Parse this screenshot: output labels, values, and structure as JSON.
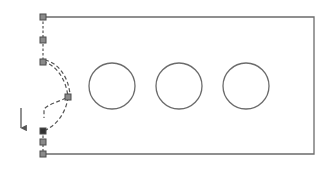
{
  "diagram": {
    "title": "",
    "colors": {
      "outline": "#6b6b6b",
      "node_fill": "#8a8a8a",
      "node_stroke": "#4a4a4a",
      "node_dark_fill": "#333333",
      "dashed": "#555555",
      "arrow": "#555555",
      "background": "#ffffff"
    },
    "panel": {
      "x": 43,
      "y": 17,
      "width": 271,
      "height": 137
    },
    "circles": [
      {
        "id": "circle-1",
        "cx": 112,
        "cy": 86,
        "r": 23
      },
      {
        "id": "circle-2",
        "cx": 179,
        "cy": 86,
        "r": 23
      },
      {
        "id": "circle-3",
        "cx": 246,
        "cy": 86,
        "r": 23
      }
    ],
    "nodes": [
      {
        "id": "node-top-corner",
        "x": 43,
        "y": 17,
        "dark": false
      },
      {
        "id": "node-upper",
        "x": 43,
        "y": 40,
        "dark": false
      },
      {
        "id": "node-hinge-top",
        "x": 43,
        "y": 62,
        "dark": false
      },
      {
        "id": "node-swing",
        "x": 68,
        "y": 97,
        "dark": false
      },
      {
        "id": "node-hinge-bottom",
        "x": 43,
        "y": 131,
        "dark": true
      },
      {
        "id": "node-lower",
        "x": 43,
        "y": 142,
        "dark": false
      },
      {
        "id": "node-bottom-corner",
        "x": 43,
        "y": 154,
        "dark": false
      }
    ],
    "direction_arrow": {
      "x": 21,
      "y1": 108,
      "y2": 131,
      "direction": "down"
    }
  }
}
